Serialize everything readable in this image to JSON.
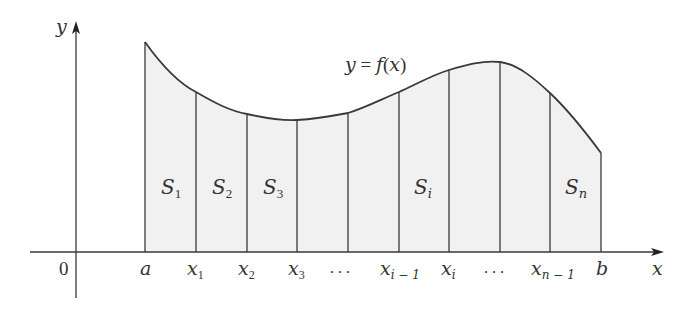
{
  "diagram": {
    "curve_label": "y = f(x)",
    "axes": {
      "x_label": "x",
      "y_label": "y",
      "origin_label": "0"
    },
    "colors": {
      "stroke": "#3a3a3a",
      "fill": "#f1f1f1",
      "text": "#333333"
    },
    "x_ticks": [
      {
        "base": "a",
        "sub": ""
      },
      {
        "base": "x",
        "sub": "1"
      },
      {
        "base": "x",
        "sub": "2"
      },
      {
        "base": "x",
        "sub": "3"
      },
      {
        "base": ". . .",
        "sub": ""
      },
      {
        "base": "x",
        "sub": "i − 1"
      },
      {
        "base": "x",
        "sub": "i"
      },
      {
        "base": ". . .",
        "sub": ""
      },
      {
        "base": "x",
        "sub": "n − 1"
      },
      {
        "base": "b",
        "sub": ""
      }
    ],
    "strips": [
      {
        "base": "S",
        "sub": "1"
      },
      {
        "base": "S",
        "sub": "2"
      },
      {
        "base": "S",
        "sub": "3"
      },
      {
        "base": "S",
        "sub": "i"
      },
      {
        "base": "S",
        "sub": "n"
      }
    ],
    "strip_count_shown": 9,
    "labels": {
      "a": "a",
      "b": "b",
      "x1": "x",
      "x1_sub": "1",
      "x2": "x",
      "x2_sub": "2",
      "x3": "x",
      "x3_sub": "3",
      "xim1": "x",
      "xim1_sub": "i − 1",
      "xi": "x",
      "xi_sub": "i",
      "xnm1": "x",
      "xnm1_sub": "n − 1",
      "dots": ". . .",
      "S1": "S",
      "S1_sub": "1",
      "S2": "S",
      "S2_sub": "2",
      "S3": "S",
      "S3_sub": "3",
      "Si": "S",
      "Si_sub": "i",
      "Sn": "S",
      "Sn_sub": "n",
      "curve_y": "y",
      "curve_eq": " = ",
      "curve_f": "f",
      "curve_paren_open": "(",
      "curve_x": "x",
      "curve_paren_close": ")"
    }
  }
}
